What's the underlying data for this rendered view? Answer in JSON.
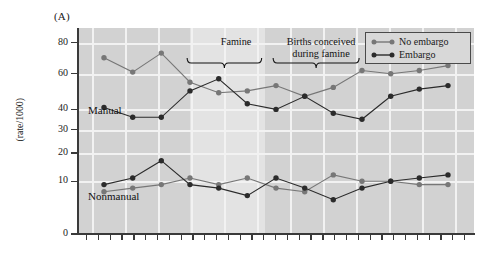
{
  "panel": {
    "letter": "(A)"
  },
  "axes": {
    "y_title_line1": "Mild mental retardation",
    "y_title_line2": "(rate/1000)",
    "y_ticks": [
      0,
      10,
      20,
      30,
      40,
      60,
      80
    ],
    "y_tick_labels": [
      "0",
      "10",
      "20",
      "30",
      "40",
      "60",
      "80"
    ]
  },
  "group_labels": {
    "manual": "Manual",
    "nonmanual": "Nonmanual"
  },
  "annotations": {
    "famine": "Famine",
    "births_line1": "Births conceived",
    "births_line2": "during famine"
  },
  "legend": {
    "items": [
      {
        "label": "No embargo",
        "color": "#777777"
      },
      {
        "label": "Embargo",
        "color": "#2b2b2b"
      }
    ]
  },
  "colors": {
    "plot_background": "#d2d2d2",
    "famine_band": "#e3e3e3",
    "gridline": "#f2f2f2",
    "axis": "#3a3a3a",
    "no_embargo": "#777777",
    "embargo": "#2b2b2b"
  },
  "chart_data": {
    "type": "line",
    "title": "",
    "xlabel": "",
    "ylabel": "Mild mental retardation (rate/1000)",
    "ylim": [
      0,
      90
    ],
    "y_scale": "sqrt-like",
    "yticks": [
      0,
      10,
      20,
      30,
      40,
      60,
      80
    ],
    "grid": true,
    "legend_position": "top-right",
    "x": [
      1,
      2,
      3,
      4,
      5,
      6,
      7,
      8,
      9,
      10,
      11,
      12,
      13
    ],
    "shaded_band": {
      "label": "Famine",
      "x_start": 4.0,
      "x_end": 6.6
    },
    "brackets": [
      {
        "label": "Famine",
        "x_start": 3.9,
        "x_end": 6.5
      },
      {
        "label": "Births conceived during famine",
        "x_start": 6.9,
        "x_end": 9.9
      }
    ],
    "series": [
      {
        "name": "Manual — No embargo",
        "group": "Manual",
        "embargo": false,
        "color": "#777777",
        "values": [
          70,
          61,
          73,
          55,
          49,
          50,
          53,
          47,
          52,
          62,
          60,
          62,
          65
        ]
      },
      {
        "name": "Manual — Embargo",
        "group": "Manual",
        "embargo": true,
        "color": "#2b2b2b",
        "values": [
          41,
          36,
          36,
          50,
          57,
          43,
          40,
          47,
          38,
          35,
          47,
          51,
          53
        ]
      },
      {
        "name": "Nonmanual — No embargo",
        "group": "Nonmanual",
        "embargo": false,
        "color": "#777777",
        "values": [
          7,
          8,
          9,
          11,
          9,
          11,
          8,
          7,
          12,
          10,
          10,
          9,
          9
        ]
      },
      {
        "name": "Nonmanual — Embargo",
        "group": "Nonmanual",
        "embargo": true,
        "color": "#2b2b2b",
        "values": [
          9,
          11,
          17,
          9,
          8,
          6,
          11,
          8,
          5,
          8,
          10,
          11,
          12
        ]
      }
    ]
  }
}
